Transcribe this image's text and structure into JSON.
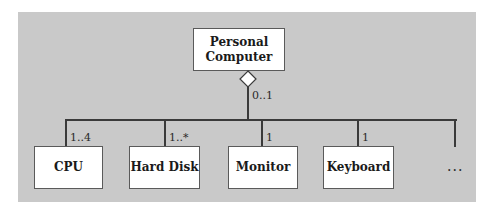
{
  "diagram": {
    "type": "UML aggregation",
    "whole": {
      "label": "Personal Computer",
      "line1": "Personal",
      "line2": "Computer",
      "multiplicity": "0..1"
    },
    "parts": [
      {
        "label": "CPU",
        "multiplicity": "1..4"
      },
      {
        "label": "Hard Disk",
        "multiplicity": "1..*"
      },
      {
        "label": "Monitor",
        "multiplicity": "1"
      },
      {
        "label": "Keyboard",
        "multiplicity": "1"
      }
    ],
    "more": "..."
  }
}
